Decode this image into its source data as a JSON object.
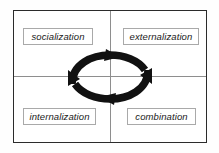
{
  "diagram": {
    "frame": {
      "border_color": "#2b2b2b",
      "background_color": "#ffffff"
    },
    "divider_color": "#8e8e8e",
    "quadrants": [
      {
        "id": "socialization",
        "label": "socialization",
        "position": "top-left"
      },
      {
        "id": "externalization",
        "label": "externalization",
        "position": "top-right"
      },
      {
        "id": "internalization",
        "label": "internalization",
        "position": "bottom-left"
      },
      {
        "id": "combination",
        "label": "combination",
        "position": "bottom-right"
      }
    ],
    "cycle": {
      "shape": "ellipse",
      "direction": "clockwise",
      "color": "#111111",
      "arrowhead_count": 4,
      "arrowhead_positions": [
        "top-center",
        "right",
        "bottom-center",
        "left"
      ]
    }
  }
}
